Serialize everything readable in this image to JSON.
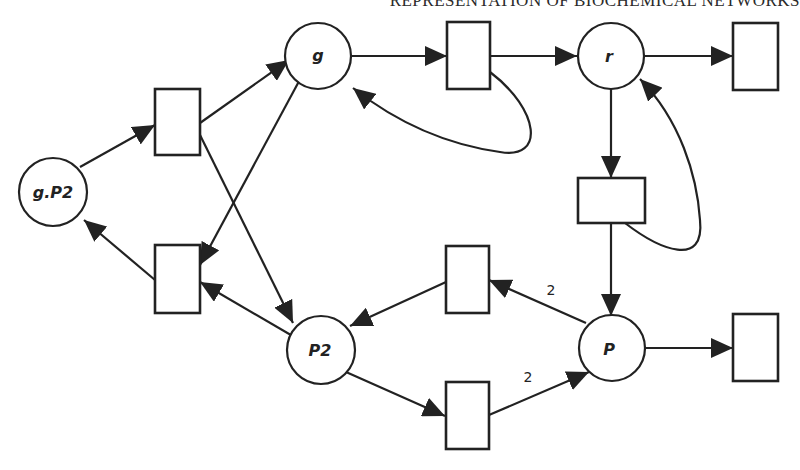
{
  "header": {
    "running_title": "REPRESENTATION OF BIOCHEMICAL NETWORKS"
  },
  "diagram": {
    "type": "petri-net",
    "colors": {
      "stroke": "#222222",
      "fill": "#ffffff",
      "background": "#ffffff"
    },
    "places": [
      {
        "id": "g",
        "label": "g"
      },
      {
        "id": "r",
        "label": "r"
      },
      {
        "id": "gP2",
        "label": "g.P2"
      },
      {
        "id": "P2",
        "label": "P2"
      },
      {
        "id": "P",
        "label": "P"
      }
    ],
    "transitions": [
      {
        "id": "t_bind",
        "desc": "g.P2 -> g + P2 (top-left)"
      },
      {
        "id": "t_unbind",
        "desc": "g + P2 -> g.P2 (bottom-left)"
      },
      {
        "id": "t_transcription",
        "desc": "g -> g + r (top-middle)"
      },
      {
        "id": "t_r_decay",
        "desc": "r -> (top-right)"
      },
      {
        "id": "t_translation",
        "desc": "r -> r + P (middle-right)"
      },
      {
        "id": "t_dimerize",
        "desc": "2P -> P2 (middle)"
      },
      {
        "id": "t_dissociate",
        "desc": "P2 -> 2P (bottom-middle)"
      },
      {
        "id": "t_P_decay",
        "desc": "P -> (bottom-right)"
      }
    ],
    "arc_weights": {
      "P_to_dimerize": "2",
      "dissociate_to_P": "2"
    }
  }
}
